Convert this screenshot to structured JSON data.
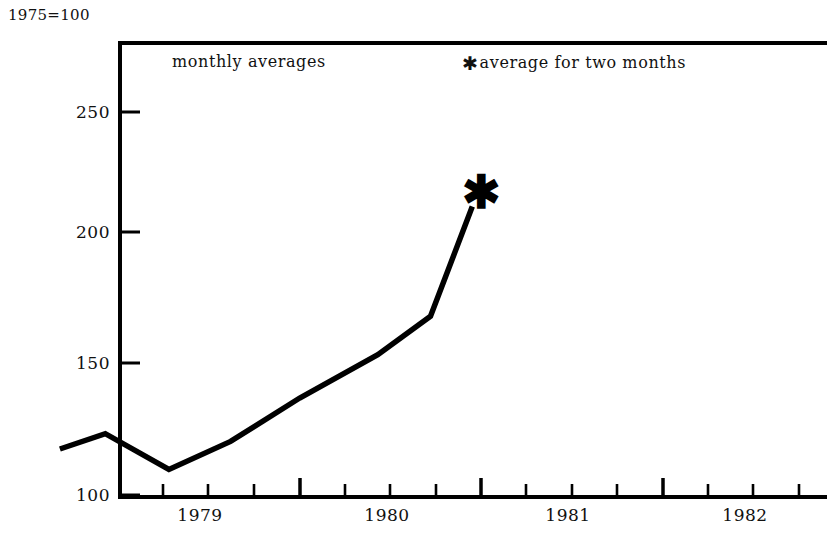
{
  "figure": {
    "index_note": "1975=100"
  },
  "legend": {
    "monthly_label": "monthly averages",
    "star_glyph": "✱",
    "star_label": "average for two months"
  },
  "chart_data": {
    "type": "line",
    "title": "",
    "subtitle": "",
    "xlabel": "",
    "ylabel": "1975=100",
    "xlim": [
      1978.5,
      1982.9
    ],
    "ylim": [
      100,
      258
    ],
    "grid": false,
    "legend_position": "top-inside",
    "yticks": [
      100,
      150,
      200,
      250
    ],
    "ytick_labels": [
      "100",
      "150",
      "200",
      "250"
    ],
    "xticks": [
      1979,
      1980,
      1981,
      1982
    ],
    "xtick_labels": [
      "1979",
      "1980",
      "1981",
      "1982"
    ],
    "x_minor_ticks_per_year": 4,
    "series": [
      {
        "name": "monthly averages",
        "x": [
          1978.68,
          1978.93,
          1979.28,
          1979.62,
          1980.0,
          1980.43,
          1980.72,
          1980.95
        ],
        "values": [
          118,
          124,
          110,
          121,
          138,
          155,
          170,
          213
        ],
        "line_color": "#000000",
        "line_width": 5
      }
    ],
    "annotations": [
      {
        "name": "two-month-average-marker",
        "marker": "✱",
        "x": 1981.0,
        "y": 213,
        "note": "average for two months"
      }
    ]
  },
  "axis": {
    "ytick_positions_px": [
      112,
      232,
      363,
      495
    ],
    "xtick_major_positions_px": [
      118,
      300,
      481,
      663
    ],
    "x_label_positions_px": [
      200,
      387,
      568,
      745
    ]
  }
}
